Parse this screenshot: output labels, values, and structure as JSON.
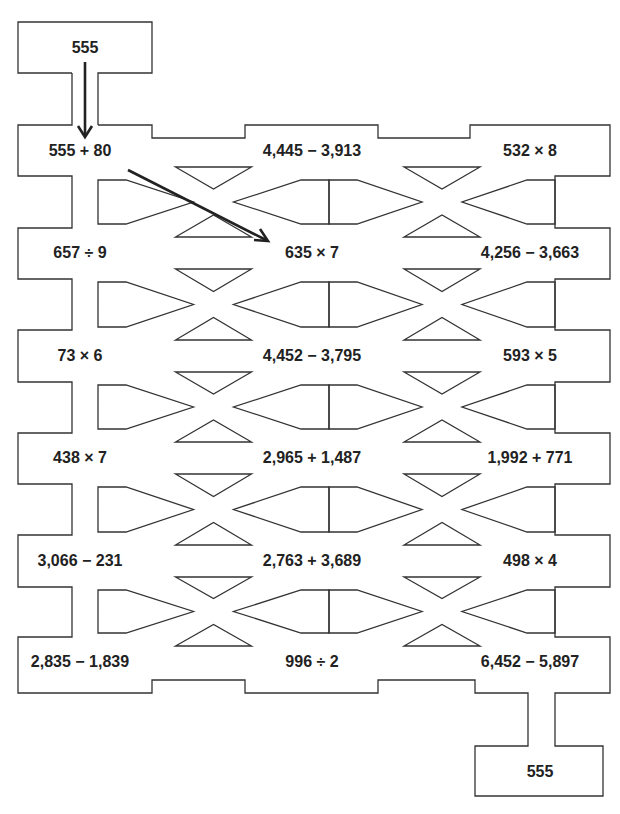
{
  "puzzle": {
    "start_label": "555",
    "end_label": "555",
    "rows": [
      [
        "555 + 80",
        "4,445 − 3,913",
        "532 × 8"
      ],
      [
        "657 ÷ 9",
        "635 × 7",
        "4,256 − 3,663"
      ],
      [
        "73 × 6",
        "4,452 − 3,795",
        "593 × 5"
      ],
      [
        "438 × 7",
        "2,965 + 1,487",
        "1,992 + 771"
      ],
      [
        "3,066 − 231",
        "2,763 + 3,689",
        "498 × 4"
      ],
      [
        "2,835 − 1,839",
        "996 ÷ 2",
        "6,452 − 5,897"
      ]
    ],
    "colors": {
      "line": "#333333",
      "text": "#222222",
      "background": "#ffffff"
    }
  }
}
